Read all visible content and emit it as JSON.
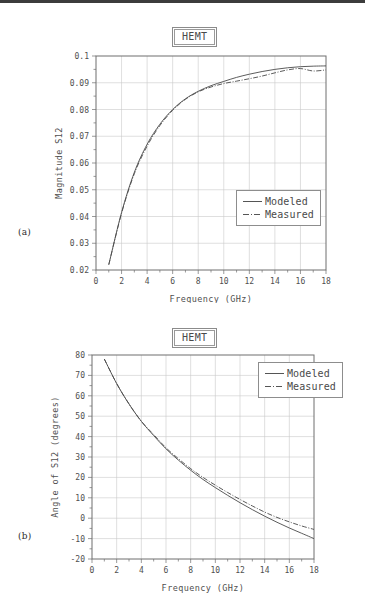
{
  "figure": {
    "panels": [
      {
        "panel_label": "(a)",
        "title": "HEMT",
        "legend": [
          {
            "label": "Modeled",
            "style": "solid"
          },
          {
            "label": "Measured",
            "style": "dashdot"
          }
        ]
      },
      {
        "panel_label": "(b)",
        "title": "HEMT",
        "legend": [
          {
            "label": "Modeled",
            "style": "solid"
          },
          {
            "label": "Measured",
            "style": "dashdot"
          }
        ]
      }
    ]
  },
  "chart_data": [
    {
      "type": "line",
      "title": "HEMT",
      "panel": "(a)",
      "xlabel": "Frequency (GHz)",
      "ylabel": "Magnitude S12",
      "xlim": [
        0,
        18
      ],
      "ylim": [
        0.02,
        0.1
      ],
      "xticks": [
        0,
        2,
        4,
        6,
        8,
        10,
        12,
        14,
        16,
        18
      ],
      "xtick_labels": [
        "0",
        "2",
        "4",
        "6",
        "8",
        "10",
        "12",
        "14",
        "16",
        "18"
      ],
      "yticks": [
        0.02,
        0.03,
        0.04,
        0.05,
        0.06,
        0.07,
        0.08,
        0.09,
        0.1
      ],
      "ytick_labels": [
        "0.02",
        "0.03",
        "0.04",
        "0.05",
        "0.06",
        "0.07",
        "0.08",
        "0.09",
        "0.1"
      ],
      "grid": true,
      "legend_position": "lower-right",
      "x": [
        1,
        2,
        3,
        4,
        5,
        6,
        7,
        8,
        9,
        10,
        11,
        12,
        13,
        14,
        15,
        16,
        17,
        18
      ],
      "series": [
        {
          "name": "Modeled",
          "style": "solid",
          "values": [
            0.022,
            0.0415,
            0.0565,
            0.067,
            0.0745,
            0.08,
            0.084,
            0.0868,
            0.0889,
            0.0905,
            0.092,
            0.0932,
            0.0942,
            0.095,
            0.0956,
            0.096,
            0.0962,
            0.0963
          ]
        },
        {
          "name": "Measured",
          "style": "dashdot",
          "values": [
            0.022,
            0.0412,
            0.056,
            0.0663,
            0.074,
            0.0797,
            0.0838,
            0.0866,
            0.0884,
            0.0897,
            0.0906,
            0.0915,
            0.0925,
            0.0937,
            0.0948,
            0.0953,
            0.0944,
            0.0948
          ]
        }
      ]
    },
    {
      "type": "line",
      "title": "HEMT",
      "panel": "(b)",
      "xlabel": "Frequency (GHz)",
      "ylabel": "Angle of S12 (degrees)",
      "xlim": [
        0,
        18
      ],
      "ylim": [
        -20,
        80
      ],
      "xticks": [
        0,
        2,
        4,
        6,
        8,
        10,
        12,
        14,
        16,
        18
      ],
      "xtick_labels": [
        "0",
        "2",
        "4",
        "6",
        "8",
        "10",
        "12",
        "14",
        "16",
        "18"
      ],
      "yticks": [
        -20,
        -10,
        0,
        10,
        20,
        30,
        40,
        50,
        60,
        70,
        80
      ],
      "ytick_labels": [
        "-20",
        "-10",
        "0",
        "10",
        "20",
        "30",
        "40",
        "50",
        "60",
        "70",
        "80"
      ],
      "grid": true,
      "legend_position": "upper-right",
      "x": [
        1,
        2,
        3,
        4,
        5,
        6,
        7,
        8,
        9,
        10,
        11,
        12,
        13,
        14,
        15,
        16,
        17,
        18
      ],
      "series": [
        {
          "name": "Modeled",
          "style": "solid",
          "values": [
            78.0,
            66.0,
            56.0,
            47.5,
            40.5,
            34.0,
            28.5,
            23.5,
            19.0,
            15.0,
            11.2,
            7.6,
            4.2,
            1.0,
            -2.0,
            -4.8,
            -7.4,
            -10.0
          ]
        },
        {
          "name": "Measured",
          "style": "dashdot",
          "values": [
            78.0,
            66.0,
            56.0,
            47.5,
            41.0,
            34.5,
            29.2,
            24.3,
            20.0,
            16.2,
            12.6,
            9.2,
            6.0,
            3.0,
            0.4,
            -1.8,
            -3.8,
            -5.5
          ]
        }
      ]
    }
  ]
}
